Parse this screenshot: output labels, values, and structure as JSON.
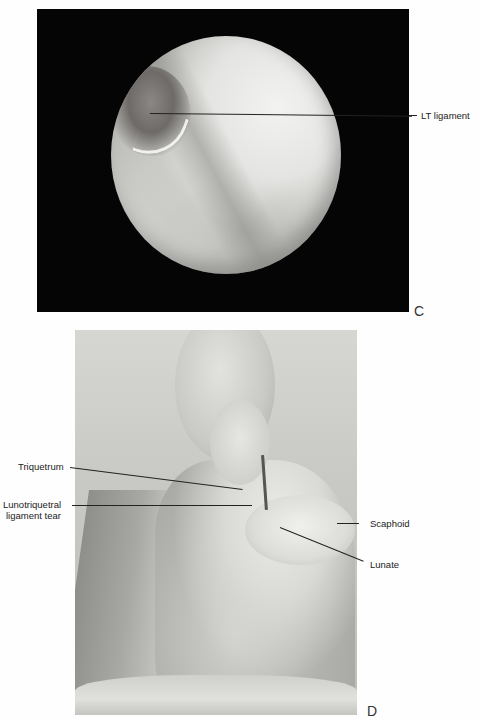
{
  "figure": {
    "panel_c": {
      "letter": "C",
      "labels": [
        {
          "text": "LT ligament"
        }
      ]
    },
    "panel_d": {
      "letter": "D",
      "labels_left": [
        {
          "text": "Triquetrum"
        },
        {
          "text_line1": "Lunotriquetral",
          "text_line2": "ligament tear"
        }
      ],
      "labels_right": [
        {
          "text": "Scaphoid"
        },
        {
          "text": "Lunate"
        }
      ]
    }
  }
}
